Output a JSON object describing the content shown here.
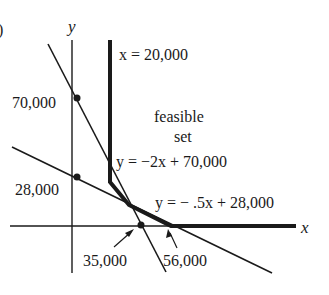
{
  "figure": {
    "part_marker": ")",
    "axes": {
      "x_label": "x",
      "y_label": "y"
    },
    "constraints": [
      {
        "id": "vertical",
        "equation": "x = 20,000"
      },
      {
        "id": "steep",
        "equation": "y = −2x + 70,000"
      },
      {
        "id": "shallow",
        "equation": "y = − .5x + 28,000"
      }
    ],
    "region_label_line1": "feasible",
    "region_label_line2": "set",
    "intercepts": {
      "y_steep": "70,000",
      "y_shallow": "28,000",
      "x_steep": "35,000",
      "x_shallow": "56,000"
    },
    "colors": {
      "ink": "#1a1a1a",
      "background": "#ffffff"
    }
  }
}
